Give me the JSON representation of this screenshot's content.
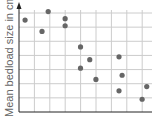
{
  "chart_data": {
    "type": "scatter",
    "title": "",
    "xlabel": "",
    "ylabel": "Mean bedload size in cm",
    "xlim": [
      0,
      8.5
    ],
    "ylim": [
      0,
      7
    ],
    "grid": true,
    "x_ticks": [
      1,
      2,
      3,
      4,
      5,
      6,
      7,
      8
    ],
    "y_ticks": [
      1,
      2,
      3,
      4,
      5,
      6,
      7
    ],
    "points": [
      {
        "x": 0.2,
        "y": 6.5
      },
      {
        "x": 1.7,
        "y": 7.1
      },
      {
        "x": 2.8,
        "y": 6.6
      },
      {
        "x": 2.8,
        "y": 6.1
      },
      {
        "x": 1.3,
        "y": 5.7
      },
      {
        "x": 3.8,
        "y": 4.6
      },
      {
        "x": 4.4,
        "y": 3.7
      },
      {
        "x": 3.8,
        "y": 3.1
      },
      {
        "x": 4.8,
        "y": 2.3
      },
      {
        "x": 6.3,
        "y": 3.9
      },
      {
        "x": 6.5,
        "y": 2.6
      },
      {
        "x": 6.3,
        "y": 1.5
      },
      {
        "x": 8.1,
        "y": 1.8
      },
      {
        "x": 7.8,
        "y": 0.9
      }
    ],
    "colors": {
      "point": "#666666",
      "grid": "#cccccc",
      "axis": "#222222"
    }
  }
}
